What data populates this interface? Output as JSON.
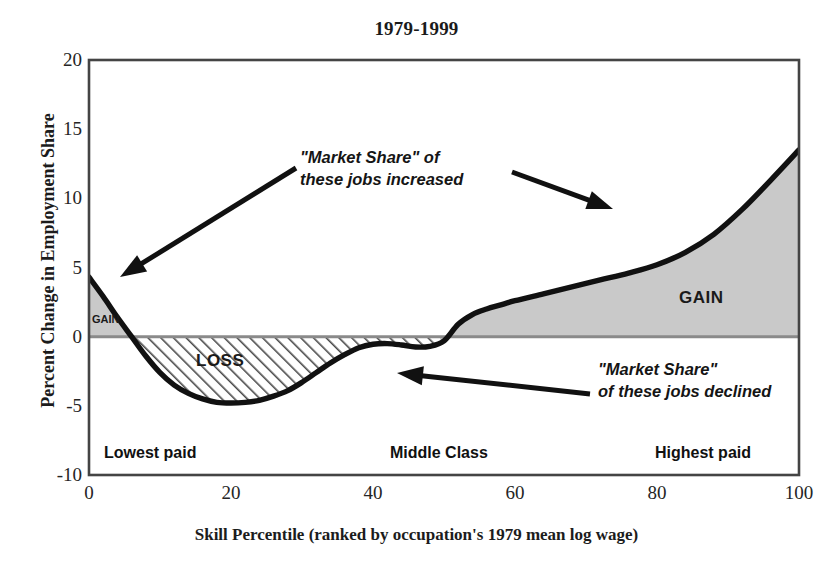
{
  "chart_data": {
    "type": "area",
    "title": "1979-1999",
    "xlabel": "Skill  Percentile (ranked by occupation's 1979 mean log wage)",
    "ylabel": "Percent Change in Employment Share",
    "xlim": [
      0,
      100
    ],
    "ylim": [
      -10,
      20
    ],
    "xticks": [
      0,
      20,
      40,
      60,
      80,
      100
    ],
    "yticks": [
      -10,
      -5,
      0,
      5,
      10,
      15,
      20
    ],
    "grid": false,
    "legend": "none",
    "zero_line": 0,
    "series": [
      {
        "name": "Percent Change in Employment Share",
        "x": [
          0,
          2,
          4,
          6,
          8,
          10,
          12,
          14,
          16,
          18,
          20,
          22,
          24,
          26,
          28,
          30,
          32,
          34,
          36,
          38,
          40,
          42,
          44,
          46,
          48,
          50,
          52,
          54,
          56,
          58,
          60,
          64,
          68,
          72,
          76,
          80,
          84,
          88,
          92,
          96,
          100
        ],
        "values": [
          4.3,
          2.9,
          1.4,
          0.0,
          -1.4,
          -2.6,
          -3.5,
          -4.1,
          -4.5,
          -4.75,
          -4.8,
          -4.75,
          -4.6,
          -4.3,
          -3.9,
          -3.3,
          -2.6,
          -1.9,
          -1.3,
          -0.8,
          -0.55,
          -0.5,
          -0.6,
          -0.75,
          -0.7,
          -0.3,
          0.9,
          1.6,
          2.0,
          2.3,
          2.6,
          3.1,
          3.6,
          4.1,
          4.6,
          5.2,
          6.1,
          7.4,
          9.2,
          11.3,
          13.5
        ]
      }
    ],
    "regions": [
      {
        "label": "GAIN",
        "id": "gain-left",
        "x_range": [
          0,
          6
        ],
        "fill": "solid-gray"
      },
      {
        "label": "LOSS",
        "id": "loss",
        "x_range": [
          6,
          49.5
        ],
        "fill": "diagonal-hatch"
      },
      {
        "label": "GAIN",
        "id": "gain-right",
        "x_range": [
          49.5,
          100
        ],
        "fill": "solid-gray"
      }
    ],
    "annotations": [
      {
        "id": "increased",
        "text_lines": [
          "\"Market Share\" of",
          "these jobs increased"
        ]
      },
      {
        "id": "declined",
        "text_lines": [
          "\"Market Share\"",
          "of these jobs declined"
        ]
      }
    ],
    "band_labels": [
      {
        "id": "lowest",
        "text": "Lowest paid"
      },
      {
        "id": "middle",
        "text": "Middle Class"
      },
      {
        "id": "highest",
        "text": "Highest paid"
      }
    ],
    "colors": {
      "curve": "#111111",
      "gain_fill": "#c9c9c9",
      "loss_hatch": "#4a4a4a",
      "frame": "#444444",
      "zero_line": "#8a8a8a",
      "text": "#1a1a1a"
    }
  },
  "ticks": {
    "y": {
      "t20": "20",
      "t15": "15",
      "t10": "10",
      "t5": "5",
      "t0": "0",
      "tm5": "-5",
      "tm10": "-10"
    },
    "x": {
      "t0": "0",
      "t20": "20",
      "t40": "40",
      "t60": "60",
      "t80": "80",
      "t100": "100"
    }
  },
  "labels": {
    "title": "1979-1999",
    "y_axis": "Percent Change in Employment Share",
    "x_axis": "Skill  Percentile (ranked by occupation's 1979 mean log wage)",
    "gain_left": "GAIN",
    "loss": "LOSS",
    "gain_right": "GAIN",
    "band_lowest": "Lowest paid",
    "band_middle": "Middle Class",
    "band_highest": "Highest paid",
    "callout_increased_l1": "\"Market Share\" of",
    "callout_increased_l2": "these jobs increased",
    "callout_declined_l1": "\"Market Share\"",
    "callout_declined_l2": "of these jobs declined"
  }
}
